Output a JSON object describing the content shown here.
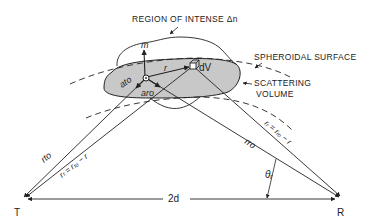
{
  "figure": {
    "type": "bistatic scattering geometry",
    "colors": {
      "ink": "#222222",
      "shade": "#c8c8c8",
      "background": "#ffffff"
    }
  },
  "labels": {
    "region": "REGION OF INTENSE Δn",
    "spheroidal_surface": "SPHEROIDAL SURFACE",
    "scattering_volume_line1": "SCATTERING",
    "scattering_volume_line2": "VOLUME",
    "dV": "dV",
    "m_vector": "m",
    "r_vector": "r",
    "a_to": "ato",
    "a_ro": "aro",
    "r_to": "rto",
    "r_t_eq": "rₜ = rₜₒ − r",
    "r_ro": "rro",
    "r_r_eq": "rᵣ = rᵣₒ − r",
    "theta_r": "θᵣ",
    "baseline": "2d",
    "transmitter": "T",
    "receiver": "R"
  }
}
